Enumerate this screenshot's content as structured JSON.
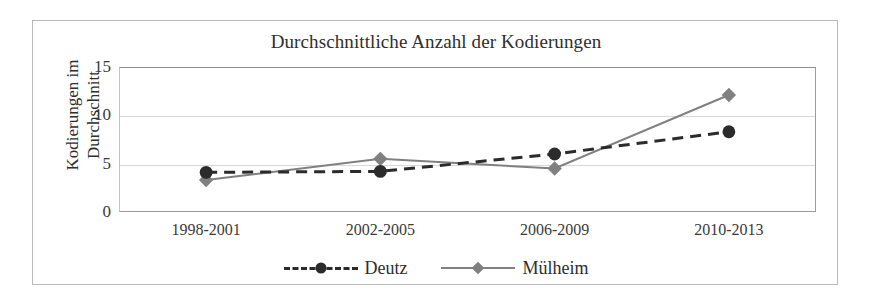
{
  "chart_data": {
    "type": "line",
    "title": "Durchschnittliche Anzahl der Kodierungen",
    "xlabel": "",
    "ylabel_lines": [
      "Kodierungen im",
      "Durchschnitt"
    ],
    "ylabel": "Kodierungen im Durchschnitt",
    "categories": [
      "1998-2001",
      "2002-2005",
      "2006-2009",
      "2010-2013"
    ],
    "ylim": [
      0,
      15
    ],
    "yticks": [
      0,
      5,
      10,
      15
    ],
    "grid": true,
    "legend_position": "bottom",
    "series": [
      {
        "name": "Deutz",
        "values": [
          4.1,
          4.2,
          6.0,
          8.3
        ],
        "color": "#2b2b2b",
        "line_style": "dashed",
        "marker": "circle"
      },
      {
        "name": "Mülheim",
        "values": [
          3.3,
          5.5,
          4.5,
          12.1
        ],
        "color": "#808080",
        "line_style": "solid",
        "marker": "diamond"
      }
    ]
  },
  "colors": {
    "deutz": "#2b2b2b",
    "muelheim": "#808080",
    "grid": "#d8d8d8",
    "frame": "#b9b9b9",
    "text": "#2e2e2e"
  }
}
